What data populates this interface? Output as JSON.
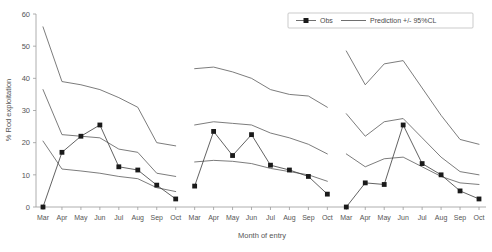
{
  "chart_data": {
    "type": "line",
    "title": "",
    "xlabel": "Month of entry",
    "ylabel": "% Rod exploitation",
    "ylim": [
      0,
      60
    ],
    "yticks": [
      0,
      10,
      20,
      30,
      40,
      50,
      60
    ],
    "grid": false,
    "legend_position": "top-right",
    "categories": [
      "Mar",
      "Apr",
      "May",
      "Jun",
      "Jul",
      "Aug",
      "Sep",
      "Oct",
      "Mar",
      "Apr",
      "May",
      "Jun",
      "Jul",
      "Aug",
      "Sep",
      "Oct",
      "Mar",
      "Apr",
      "May",
      "Jun",
      "Jul",
      "Aug",
      "Sep",
      "Oct"
    ],
    "legend": [
      "Obs",
      "Prediction +/- 95%CL"
    ],
    "series": [
      {
        "name": "Upper 95%CL",
        "style": "line",
        "values": [
          56.0,
          39.0,
          38.0,
          36.5,
          34.0,
          31.0,
          20.0,
          19.0,
          43.0,
          43.5,
          42.0,
          40.0,
          36.5,
          35.0,
          34.5,
          31.0,
          48.5,
          38.0,
          44.5,
          45.5,
          37.0,
          28.5,
          21.0,
          19.5
        ]
      },
      {
        "name": "Prediction",
        "style": "line",
        "values": [
          36.5,
          22.5,
          22.0,
          21.5,
          18.0,
          17.0,
          10.5,
          9.5,
          25.5,
          26.5,
          26.0,
          25.5,
          23.0,
          21.5,
          19.5,
          16.5,
          29.0,
          22.0,
          26.5,
          27.5,
          21.5,
          15.5,
          11.0,
          10.0
        ]
      },
      {
        "name": "Lower 95%CL",
        "style": "line",
        "values": [
          20.5,
          11.8,
          11.2,
          10.5,
          9.5,
          8.8,
          6.0,
          4.8,
          14.0,
          14.5,
          14.2,
          13.5,
          12.0,
          11.0,
          10.0,
          8.0,
          16.5,
          12.5,
          15.0,
          15.5,
          12.5,
          9.5,
          7.5,
          7.0
        ]
      },
      {
        "name": "Obs",
        "style": "line-marker",
        "values": [
          0.0,
          17.0,
          22.0,
          25.5,
          12.5,
          11.5,
          6.8,
          2.5,
          6.5,
          23.5,
          16.0,
          22.5,
          13.0,
          11.5,
          9.5,
          4.0,
          0.0,
          7.5,
          7.0,
          25.5,
          13.5,
          10.0,
          5.0,
          2.5
        ]
      }
    ]
  },
  "legend": {
    "obs_label": "Obs",
    "prediction_label": "Prediction +/- 95%CL"
  },
  "axes": {
    "x_title": "Month of entry",
    "y_title": "% Rod exploitation"
  }
}
